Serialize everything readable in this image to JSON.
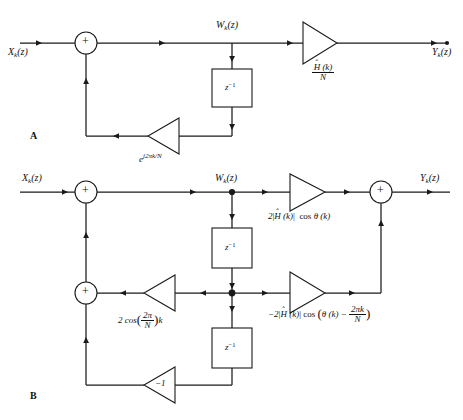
{
  "figure": {
    "type": "block-diagram",
    "background_color": "#ffffff",
    "line_color": "#1a1a1a"
  },
  "panels": [
    {
      "letter": "A",
      "name": "complex-resonator",
      "input_label": "X",
      "input_sub": "k",
      "input_arg": "(z)",
      "internal_label": "W",
      "internal_sub": "k",
      "internal_arg": "(z)",
      "output_label": "Y",
      "output_sub": "k",
      "output_arg": "(z)",
      "adder_sign": "+",
      "delay_label": "z",
      "delay_exponent": "-1",
      "feedback_gain": "e^{j2πk/N}",
      "forward_gain_numerator": "Ĥ (k)",
      "forward_gain_denominator": "N"
    },
    {
      "letter": "B",
      "name": "real-second-order-resonator",
      "input_label": "X",
      "input_sub": "k",
      "input_arg": "(z)",
      "internal_label": "W",
      "internal_sub": "k",
      "internal_arg": "(z)",
      "output_label": "Y",
      "output_sub": "k",
      "output_arg": "(z)",
      "adder_sign": "+",
      "delay_label": "z",
      "delay_exponent": "-1",
      "feedback_gain_cos": "2 cos(2π/N)k",
      "feedback_gain_neg_one": "−1",
      "forward_gain_top": "2|Ĥ (k)|  cos θ (k)",
      "forward_gain_bottom": "−2|Ĥ (k)| cos(θ (k) − 2πk/N)"
    }
  ],
  "labels": {
    "panel_a_letter": "A",
    "panel_b_letter": "B",
    "x_base": "X",
    "y_base": "Y",
    "w_base": "W",
    "k_sub": "k",
    "z_arg": "(z)",
    "plus": "+",
    "z_sym": "z",
    "z_exp": "−1",
    "e_sym": "e",
    "e_exp": "j2πk/N",
    "hat_h": "H",
    "hat_mark": "ˆ",
    "h_arg": "(k)",
    "n_den": "N",
    "two": "2",
    "cos": "cos",
    "theta": "θ",
    "theta_arg": "(k)",
    "abs_bar": "|",
    "two_pi_over_n_k": "2πk",
    "two_pi": "2π",
    "k_it": "k",
    "minus": "−",
    "minus_one": "−1",
    "gain_b_cos_prefix": "2 cos",
    "gain_b_top_full": "2|Ĥ (k)|  cos θ (k)",
    "gain_b_bottom_full": "−2|Ĥ (k)| cos(θ (k) − 2πk/N)"
  }
}
